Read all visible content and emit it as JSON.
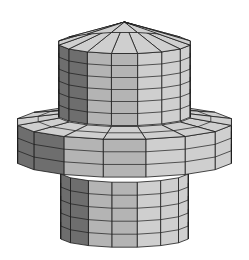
{
  "figure": {
    "width": 249,
    "height": 260,
    "background": "#ffffff",
    "shading": {
      "light": "#cfcfcf",
      "mid": "#b4b4b4",
      "dark": "#6e6e6e",
      "darkest": "#3a3a3a",
      "edge": "#1a1a1a"
    },
    "projection": {
      "cx": 124.5,
      "tilt": 0.16
    },
    "segments": 16,
    "parts": [
      {
        "name": "cone-cap",
        "type": "cone",
        "radius": 67,
        "base_y": 43,
        "apex_y": 22
      },
      {
        "name": "upper-cylinder",
        "type": "cylinder",
        "radius": 67,
        "top_y": 43,
        "bottom_y": 115,
        "rows": 6
      },
      {
        "name": "flange-top",
        "type": "annulus",
        "inner_radius": 67,
        "outer_radius": 109,
        "y": 122
      },
      {
        "name": "flange-side",
        "type": "cylinder",
        "radius": 109,
        "top_y": 122,
        "bottom_y": 160,
        "rows": 3
      },
      {
        "name": "flange-bottom-step",
        "type": "annulus",
        "inner_radius": 65,
        "outer_radius": 109,
        "y": 160
      },
      {
        "name": "lower-cylinder",
        "type": "cylinder",
        "radius": 65,
        "top_y": 172,
        "bottom_y": 237,
        "rows": 5
      }
    ]
  }
}
